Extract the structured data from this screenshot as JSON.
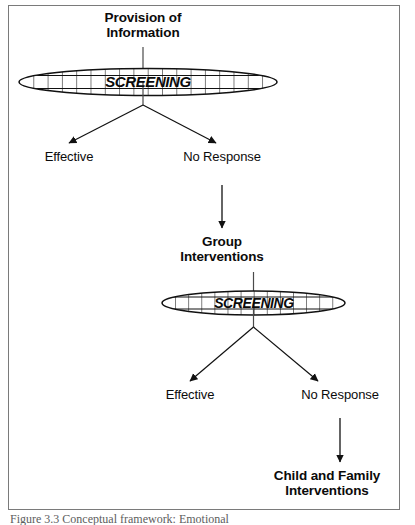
{
  "figure": {
    "caption": "Figure 3.3  Conceptual framework: Emotional",
    "frame_color": "#7a7a7a",
    "text_color": "#0b0b0b"
  },
  "nodes": {
    "provision_of_information": "Provision of\nInformation",
    "screening_one": "SCREENING",
    "effective_one": "Effective",
    "no_response_one": "No Response",
    "group_interventions": "Group\nInterventions",
    "screening_two": "SCREENING",
    "effective_two": "Effective",
    "no_response_two": "No Response",
    "child_and_family_interventions": "Child and Family\nInterventions"
  },
  "flow": {
    "edges": [
      {
        "from": "provision_of_information",
        "to": "screening_one",
        "type": "line"
      },
      {
        "from": "screening_one",
        "to": "effective_one",
        "type": "arrow"
      },
      {
        "from": "screening_one",
        "to": "no_response_one",
        "type": "arrow"
      },
      {
        "from": "no_response_one",
        "to": "group_interventions",
        "type": "arrow"
      },
      {
        "from": "group_interventions",
        "to": "screening_two",
        "type": "line"
      },
      {
        "from": "screening_two",
        "to": "effective_two",
        "type": "arrow"
      },
      {
        "from": "screening_two",
        "to": "no_response_two",
        "type": "arrow"
      },
      {
        "from": "no_response_two",
        "to": "child_and_family_interventions",
        "type": "arrow"
      }
    ]
  }
}
